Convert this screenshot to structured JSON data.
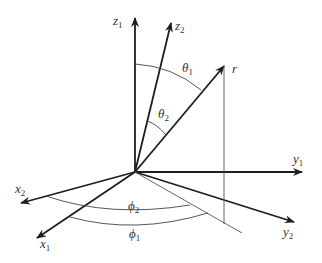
{
  "diagram": {
    "title": "",
    "labels": {
      "z1": {
        "base": "z",
        "sub": "1"
      },
      "z2": {
        "base": "z",
        "sub": "2"
      },
      "y1": {
        "base": "y",
        "sub": "1"
      },
      "y2": {
        "base": "y",
        "sub": "2"
      },
      "x1": {
        "base": "x",
        "sub": "1"
      },
      "x2": {
        "base": "x",
        "sub": "2"
      },
      "r": {
        "base": "r",
        "sub": ""
      },
      "theta1": {
        "base": "θ",
        "sub": "1"
      },
      "theta2": {
        "base": "θ",
        "sub": "2"
      },
      "phi1": {
        "base": "ϕ",
        "sub": "1"
      },
      "phi2": {
        "base": "ϕ",
        "sub": "2"
      }
    },
    "colors": {
      "axis": "#1e1e1e",
      "guide": "#555555",
      "text": "#333333"
    }
  }
}
